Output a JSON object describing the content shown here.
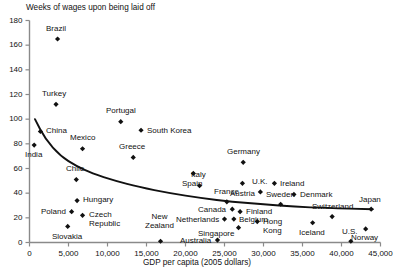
{
  "chart_data": {
    "type": "scatter",
    "title": "Weeks of wages upon being laid off",
    "xlabel": "GDP per capita (2005 dollars)",
    "ylabel": "Weeks of wages upon being laid off",
    "xlim": [
      0,
      45000
    ],
    "ylim": [
      0,
      180
    ],
    "grid": false,
    "legend": "none",
    "xticks": [
      "0",
      "5,000",
      "10,000",
      "15,000",
      "20,000",
      "25,000",
      "30,000",
      "35,000",
      "40,000",
      "45,000"
    ],
    "xtick_values": [
      0,
      5000,
      10000,
      15000,
      20000,
      25000,
      30000,
      35000,
      40000,
      45000
    ],
    "yticks": [
      "0",
      "20",
      "40",
      "60",
      "80",
      "100",
      "120",
      "140",
      "160",
      "180"
    ],
    "ytick_values": [
      0,
      20,
      40,
      60,
      80,
      100,
      120,
      140,
      160,
      180
    ],
    "marker": "diamond",
    "marker_color": "#111111",
    "trendline": {
      "visible": true,
      "color": "#111111",
      "description": "declining power-law fit from about 100 weeks at low GDP to about 28 weeks at high GDP",
      "points": [
        [
          700,
          100
        ],
        [
          2000,
          84
        ],
        [
          4000,
          70
        ],
        [
          6000,
          62
        ],
        [
          8000,
          56
        ],
        [
          11000,
          50
        ],
        [
          14000,
          45
        ],
        [
          18000,
          40
        ],
        [
          22000,
          36
        ],
        [
          26000,
          33
        ],
        [
          30000,
          31
        ],
        [
          34000,
          29
        ],
        [
          38000,
          28
        ],
        [
          44000,
          27
        ]
      ]
    },
    "points": [
      {
        "name": "Brazil",
        "x": 3600,
        "y": 165,
        "label_dx": -2,
        "label_dy": -11,
        "align": "center"
      },
      {
        "name": "Turkey",
        "x": 3400,
        "y": 112,
        "label_dx": -2,
        "label_dy": -11,
        "align": "center"
      },
      {
        "name": "Portugal",
        "x": 11700,
        "y": 98,
        "label_dx": 0,
        "label_dy": -11,
        "align": "center"
      },
      {
        "name": "South Korea",
        "x": 14300,
        "y": 91,
        "label_dx": 6,
        "label_dy": 0,
        "align": "left"
      },
      {
        "name": "China",
        "x": 1400,
        "y": 90,
        "label_dx": 6,
        "label_dy": -1,
        "align": "left"
      },
      {
        "name": "India",
        "x": 600,
        "y": 79,
        "label_dx": -1,
        "label_dy": 9,
        "align": "center"
      },
      {
        "name": "Mexico",
        "x": 6800,
        "y": 76,
        "label_dx": 0,
        "label_dy": -11,
        "align": "center"
      },
      {
        "name": "Greece",
        "x": 13300,
        "y": 69,
        "label_dx": -1,
        "label_dy": -11,
        "align": "center"
      },
      {
        "name": "Spain",
        "x": 21000,
        "y": 56,
        "label_dx": -1,
        "label_dy": 10,
        "align": "center"
      },
      {
        "name": "Chile",
        "x": 6000,
        "y": 51,
        "label_dx": -1,
        "label_dy": -11,
        "align": "center"
      },
      {
        "name": "Italy",
        "x": 21800,
        "y": 46,
        "label_dx": -1,
        "label_dy": -11,
        "align": "center"
      },
      {
        "name": "Germany",
        "x": 27400,
        "y": 65,
        "label_dx": 0,
        "label_dy": -11,
        "align": "center"
      },
      {
        "name": "Austria",
        "x": 27300,
        "y": 48,
        "label_dx": 0,
        "label_dy": 10,
        "align": "center"
      },
      {
        "name": "Ireland",
        "x": 31400,
        "y": 48,
        "label_dx": 6,
        "label_dy": 0,
        "align": "left"
      },
      {
        "name": "U.K.",
        "x": 29600,
        "y": 41,
        "label_dx": 0,
        "label_dy": -10,
        "align": "center"
      },
      {
        "name": "Denmark",
        "x": 33900,
        "y": 39,
        "label_dx": 6,
        "label_dy": 0,
        "align": "left"
      },
      {
        "name": "Hungary",
        "x": 6100,
        "y": 34,
        "label_dx": 6,
        "label_dy": -1,
        "align": "left"
      },
      {
        "name": "France",
        "x": 25300,
        "y": 33,
        "label_dx": 0,
        "label_dy": -10,
        "align": "center"
      },
      {
        "name": "Sweden",
        "x": 32200,
        "y": 31,
        "label_dx": 0,
        "label_dy": -10,
        "align": "center"
      },
      {
        "name": "Japan",
        "x": 43800,
        "y": 27,
        "label_dx": -1,
        "label_dy": -10,
        "align": "center"
      },
      {
        "name": "Canada",
        "x": 26000,
        "y": 27,
        "label_dx": -6,
        "label_dy": 0,
        "align": "right"
      },
      {
        "name": "Poland",
        "x": 5400,
        "y": 25,
        "label_dx": -6,
        "label_dy": 0,
        "align": "right"
      },
      {
        "name": "Finland",
        "x": 27000,
        "y": 25,
        "label_dx": 6,
        "label_dy": 0,
        "align": "left"
      },
      {
        "name": "Czech\nRepublic",
        "x": 6800,
        "y": 22,
        "label_dx": 6,
        "label_dy": 4,
        "align": "left"
      },
      {
        "name": "Belgium",
        "x": 26200,
        "y": 19,
        "label_dx": 5,
        "label_dy": 0,
        "align": "left"
      },
      {
        "name": "Netherlands",
        "x": 25000,
        "y": 19,
        "label_dx": -6,
        "label_dy": 0,
        "align": "right"
      },
      {
        "name": "Switzerland",
        "x": 38800,
        "y": 21,
        "label_dx": 0,
        "label_dy": -10,
        "align": "center"
      },
      {
        "name": "Hong\nKong",
        "x": 29200,
        "y": 17,
        "label_dx": 6,
        "label_dy": 4,
        "align": "left"
      },
      {
        "name": "Iceland",
        "x": 36300,
        "y": 16,
        "label_dx": -1,
        "label_dy": 10,
        "align": "center"
      },
      {
        "name": "Singapore",
        "x": 26800,
        "y": 12,
        "label_dx": -5,
        "label_dy": 6,
        "align": "right"
      },
      {
        "name": "Slovakia",
        "x": 4900,
        "y": 13,
        "label_dx": -1,
        "label_dy": 10,
        "align": "center"
      },
      {
        "name": "Norway",
        "x": 43100,
        "y": 11,
        "label_dx": -1,
        "label_dy": 9,
        "align": "center"
      },
      {
        "name": "Australia",
        "x": 24100,
        "y": 2,
        "label_dx": -6,
        "label_dy": 0,
        "align": "right"
      },
      {
        "name": "U.S.",
        "x": 41200,
        "y": 1,
        "label_dx": -1,
        "label_dy": -10,
        "align": "center"
      },
      {
        "name": "New\nZealand",
        "x": 16800,
        "y": 1,
        "label_dx": -1,
        "label_dy": -20,
        "align": "center"
      }
    ]
  },
  "colors": {
    "axis": "#8a8a8a",
    "marker": "#111111",
    "text": "#111111",
    "trend": "#111111",
    "background": "#ffffff"
  }
}
